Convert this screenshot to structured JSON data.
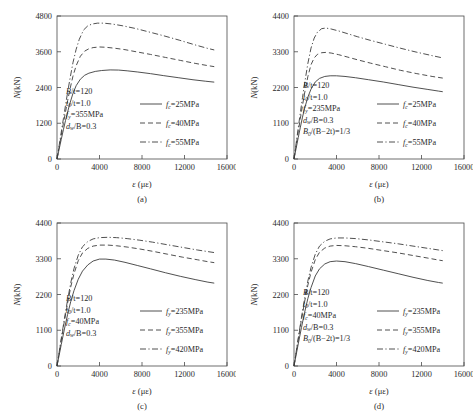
{
  "figure": {
    "panel_count": 4,
    "x_axis_label": "ε (με)",
    "y_axis_label": "N(kN)"
  },
  "chart_data": [
    {
      "type": "line",
      "panel": "a",
      "caption": "(a)",
      "title": "",
      "xlabel": "ε (με)",
      "ylabel": "N(kN)",
      "xlim": [
        0,
        16000
      ],
      "ylim": [
        0,
        4800
      ],
      "xticks": [
        0,
        4000,
        8000,
        12000,
        16000
      ],
      "yticks": [
        0,
        1200,
        2400,
        3600,
        4800
      ],
      "grid": false,
      "legend_position": "center-right",
      "annotations": [
        {
          "text": "B/t=120",
          "var": "B",
          "sub": "",
          "rest": "/t=120"
        },
        {
          "text": "t0/t=1.0",
          "var": "t",
          "sub": "0",
          "rest": "/t=1.0"
        },
        {
          "text": "fy=355MPa",
          "var": "f",
          "sub": "y",
          "rest": "=355MPa"
        },
        {
          "text": "dw/B=0.3",
          "var": "d",
          "sub": "w",
          "rest": "/B=0.3"
        }
      ],
      "series": [
        {
          "name": "fc=25MPa",
          "var": "f",
          "sub": "c",
          "rest": "=25MPa",
          "style": "solid",
          "x": [
            0,
            200,
            400,
            600,
            800,
            1000,
            1200,
            1500,
            1800,
            2200,
            2600,
            3000,
            3600,
            4200,
            5000,
            5800,
            6600,
            7600,
            8800,
            10000,
            11400,
            12800,
            14000,
            14800
          ],
          "y": [
            0,
            330,
            660,
            980,
            1290,
            1580,
            1850,
            2200,
            2460,
            2680,
            2810,
            2880,
            2940,
            2970,
            2990,
            2985,
            2960,
            2920,
            2865,
            2800,
            2730,
            2660,
            2610,
            2580
          ]
        },
        {
          "name": "fc=40MPa",
          "var": "f",
          "sub": "c",
          "rest": "=40MPa",
          "style": "dashed",
          "x": [
            0,
            200,
            400,
            600,
            800,
            1000,
            1200,
            1500,
            1800,
            2200,
            2600,
            3000,
            3400,
            4000,
            4600,
            5400,
            6400,
            7600,
            8800,
            10200,
            11600,
            13000,
            14100,
            14800
          ],
          "y": [
            0,
            400,
            800,
            1190,
            1580,
            1960,
            2310,
            2780,
            3130,
            3450,
            3620,
            3700,
            3740,
            3760,
            3750,
            3720,
            3670,
            3590,
            3510,
            3410,
            3310,
            3210,
            3140,
            3100
          ]
        },
        {
          "name": "fc=55MPa",
          "var": "f",
          "sub": "c",
          "rest": "=55MPa",
          "style": "dashdot",
          "x": [
            0,
            200,
            400,
            600,
            800,
            1000,
            1200,
            1500,
            1800,
            2100,
            2500,
            2900,
            3300,
            3800,
            4400,
            5200,
            6200,
            7400,
            8600,
            10000,
            11500,
            13000,
            14100,
            14800
          ],
          "y": [
            0,
            450,
            900,
            1350,
            1800,
            2240,
            2650,
            3230,
            3680,
            4020,
            4330,
            4470,
            4530,
            4560,
            4560,
            4530,
            4470,
            4380,
            4270,
            4140,
            3990,
            3830,
            3720,
            3660
          ]
        }
      ]
    },
    {
      "type": "line",
      "panel": "b",
      "caption": "(b)",
      "title": "",
      "xlabel": "ε (με)",
      "ylabel": "N(kN)",
      "xlim": [
        0,
        16000
      ],
      "ylim": [
        0,
        4400
      ],
      "xticks": [
        0,
        4000,
        8000,
        12000,
        16000
      ],
      "yticks": [
        0,
        1100,
        2200,
        3300,
        4400
      ],
      "grid": false,
      "legend_position": "center-right",
      "annotations": [
        {
          "text": "B/t=120",
          "var": "B",
          "sub": "",
          "rest": "/t=120"
        },
        {
          "text": "t0/t=1.0",
          "var": "t",
          "sub": "0",
          "rest": "/t=1.0"
        },
        {
          "text": "fy=235MPa",
          "var": "f",
          "sub": "y",
          "rest": "=235MPa"
        },
        {
          "text": "dw/B=0.3",
          "var": "d",
          "sub": "w",
          "rest": "/B=0.3"
        },
        {
          "text": "B0/(B−2t)=1/3",
          "var": "B",
          "sub": "0",
          "rest": "/(B−2t)=1/3"
        }
      ],
      "series": [
        {
          "name": "fc=25MPa",
          "var": "f",
          "sub": "c",
          "rest": "=25MPa",
          "style": "solid",
          "x": [
            0,
            200,
            400,
            600,
            800,
            1000,
            1300,
            1600,
            2000,
            2400,
            2900,
            3400,
            4000,
            4800,
            5800,
            7000,
            8400,
            9800,
            11200,
            12600,
            13600,
            14000
          ],
          "y": [
            0,
            330,
            660,
            980,
            1290,
            1560,
            1900,
            2150,
            2370,
            2480,
            2540,
            2560,
            2560,
            2540,
            2500,
            2440,
            2370,
            2290,
            2210,
            2140,
            2090,
            2070
          ]
        },
        {
          "name": "fc=40MPa",
          "var": "f",
          "sub": "c",
          "rest": "=40MPa",
          "style": "dashed",
          "x": [
            0,
            200,
            400,
            600,
            800,
            1000,
            1300,
            1600,
            1900,
            2200,
            2600,
            3000,
            3500,
            4200,
            5000,
            6000,
            7200,
            8600,
            10000,
            11500,
            13000,
            14000
          ],
          "y": [
            0,
            420,
            840,
            1250,
            1650,
            2030,
            2530,
            2900,
            3110,
            3220,
            3270,
            3280,
            3260,
            3210,
            3140,
            3050,
            2950,
            2840,
            2730,
            2630,
            2540,
            2490
          ]
        },
        {
          "name": "fc=55MPa",
          "var": "f",
          "sub": "c",
          "rest": "=55MPa",
          "style": "dashdot",
          "x": [
            0,
            200,
            400,
            600,
            800,
            1000,
            1300,
            1600,
            1900,
            2200,
            2600,
            3000,
            3500,
            4200,
            5000,
            6000,
            7200,
            8600,
            10000,
            11500,
            13000,
            14000
          ],
          "y": [
            0,
            480,
            960,
            1430,
            1890,
            2330,
            2930,
            3410,
            3720,
            3900,
            4010,
            4030,
            4000,
            3940,
            3860,
            3760,
            3650,
            3530,
            3410,
            3290,
            3180,
            3110
          ]
        }
      ]
    },
    {
      "type": "line",
      "panel": "c",
      "caption": "(c)",
      "title": "",
      "xlabel": "ε (με)",
      "ylabel": "N(kN)",
      "xlim": [
        0,
        16000
      ],
      "ylim": [
        0,
        4400
      ],
      "xticks": [
        0,
        4000,
        8000,
        12000,
        16000
      ],
      "yticks": [
        0,
        1100,
        2200,
        3300,
        4400
      ],
      "grid": false,
      "legend_position": "center-right",
      "annotations": [
        {
          "text": "B/t=120",
          "var": "B",
          "sub": "",
          "rest": "/t=120"
        },
        {
          "text": "t0/t=1.0",
          "var": "t",
          "sub": "0",
          "rest": "/t=1.0"
        },
        {
          "text": "fc=40MPa",
          "var": "f",
          "sub": "c",
          "rest": "=40MPa"
        },
        {
          "text": "dw/B=0.3",
          "var": "d",
          "sub": "w",
          "rest": "/B=0.3"
        }
      ],
      "series": [
        {
          "name": "fy=235MPa",
          "var": "f",
          "sub": "y",
          "rest": "=235MPa",
          "style": "solid",
          "x": [
            0,
            200,
            400,
            700,
            1000,
            1300,
            1600,
            2000,
            2400,
            2900,
            3400,
            4000,
            4600,
            5400,
            6400,
            7600,
            8800,
            10200,
            11600,
            13000,
            14200,
            14800
          ],
          "y": [
            0,
            330,
            660,
            1140,
            1590,
            1990,
            2320,
            2670,
            2920,
            3110,
            3230,
            3290,
            3290,
            3260,
            3190,
            3090,
            2990,
            2870,
            2760,
            2660,
            2580,
            2550
          ]
        },
        {
          "name": "fy=355MPa",
          "var": "f",
          "sub": "y",
          "rest": "=355MPa",
          "style": "dashed",
          "x": [
            0,
            200,
            400,
            700,
            1000,
            1300,
            1600,
            2000,
            2400,
            2900,
            3400,
            4000,
            4800,
            5600,
            6600,
            7800,
            9000,
            10400,
            11800,
            13200,
            14200,
            14800
          ],
          "y": [
            0,
            400,
            800,
            1390,
            1940,
            2440,
            2840,
            3240,
            3480,
            3620,
            3690,
            3720,
            3720,
            3700,
            3660,
            3600,
            3530,
            3440,
            3350,
            3270,
            3210,
            3180
          ]
        },
        {
          "name": "fy=420MPa",
          "var": "f",
          "sub": "y",
          "rest": "=420MPa",
          "style": "dashdot",
          "x": [
            0,
            200,
            400,
            700,
            1000,
            1300,
            1600,
            2000,
            2400,
            2900,
            3400,
            4000,
            4800,
            5600,
            6600,
            7800,
            9000,
            10400,
            11800,
            13200,
            14200,
            14800
          ],
          "y": [
            0,
            420,
            840,
            1460,
            2040,
            2570,
            3000,
            3410,
            3670,
            3830,
            3910,
            3950,
            3960,
            3950,
            3920,
            3870,
            3810,
            3730,
            3650,
            3570,
            3520,
            3490
          ]
        }
      ]
    },
    {
      "type": "line",
      "panel": "d",
      "caption": "(d)",
      "title": "",
      "xlabel": "ε (με)",
      "ylabel": "N(kN)",
      "xlim": [
        0,
        16000
      ],
      "ylim": [
        0,
        4400
      ],
      "xticks": [
        0,
        4000,
        8000,
        12000,
        16000
      ],
      "yticks": [
        0,
        1100,
        2200,
        3300,
        4400
      ],
      "grid": false,
      "legend_position": "center-right",
      "annotations": [
        {
          "text": "B/t=120",
          "var": "B",
          "sub": "",
          "rest": "/t=120"
        },
        {
          "text": "t0/t=1.0",
          "var": "t",
          "sub": "0",
          "rest": "/t=1.0"
        },
        {
          "text": "fc=40MPa",
          "var": "f",
          "sub": "c",
          "rest": "=40MPa"
        },
        {
          "text": "dw/B=0.3",
          "var": "d",
          "sub": "w",
          "rest": "/B=0.3"
        },
        {
          "text": "B0/(B−2t)=1/3",
          "var": "B",
          "sub": "0",
          "rest": "/(B−2t)=1/3"
        }
      ],
      "series": [
        {
          "name": "fy=235MPa",
          "var": "f",
          "sub": "y",
          "rest": "=235MPa",
          "style": "solid",
          "x": [
            0,
            200,
            400,
            700,
            1000,
            1300,
            1600,
            2000,
            2400,
            2900,
            3400,
            4000,
            4800,
            5800,
            7000,
            8400,
            9800,
            11200,
            12600,
            13600,
            14000
          ],
          "y": [
            0,
            340,
            680,
            1180,
            1650,
            2070,
            2410,
            2770,
            2990,
            3140,
            3210,
            3230,
            3210,
            3150,
            3060,
            2950,
            2840,
            2730,
            2630,
            2570,
            2550
          ]
        },
        {
          "name": "fy=355MPa",
          "var": "f",
          "sub": "y",
          "rest": "=355MPa",
          "style": "dashed",
          "x": [
            0,
            200,
            400,
            700,
            1000,
            1300,
            1600,
            2000,
            2400,
            2900,
            3400,
            4000,
            4800,
            5800,
            7000,
            8400,
            9800,
            11200,
            12600,
            13600,
            14000
          ],
          "y": [
            0,
            410,
            820,
            1420,
            1980,
            2480,
            2880,
            3270,
            3500,
            3630,
            3690,
            3710,
            3700,
            3670,
            3620,
            3550,
            3480,
            3400,
            3320,
            3260,
            3240
          ]
        },
        {
          "name": "fy=420MPa",
          "var": "f",
          "sub": "y",
          "rest": "=420MPa",
          "style": "dashdot",
          "x": [
            0,
            200,
            400,
            700,
            1000,
            1300,
            1600,
            2000,
            2400,
            2900,
            3400,
            4000,
            4800,
            5800,
            7000,
            8400,
            9800,
            11200,
            12600,
            13600,
            14000
          ],
          "y": [
            0,
            430,
            860,
            1490,
            2080,
            2610,
            3030,
            3440,
            3690,
            3840,
            3910,
            3940,
            3940,
            3920,
            3880,
            3820,
            3760,
            3690,
            3620,
            3570,
            3550
          ]
        }
      ]
    }
  ]
}
